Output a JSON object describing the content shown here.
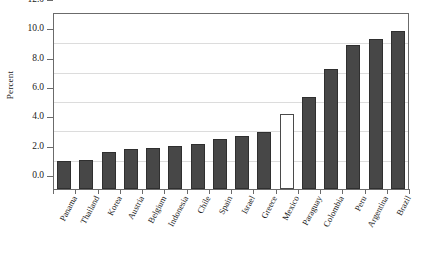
{
  "chart_data": {
    "type": "bar",
    "title": "",
    "xlabel": "",
    "ylabel": "Percent",
    "ylim": [
      0.0,
      12.0
    ],
    "ytick_values": [
      0.0,
      2.0,
      4.0,
      6.0,
      8.0,
      10.0,
      12.0
    ],
    "ytick_labels": [
      "0.0",
      "2.0",
      "4.0",
      "6.0",
      "8.0",
      "10.0",
      "12.0"
    ],
    "grid": true,
    "legend": "none",
    "categories": [
      "Panama",
      "Thailand",
      "Korea",
      "Austria",
      "Belgium",
      "Indonesia",
      "Chile",
      "Spain",
      "Israel",
      "Greece",
      "Mexico",
      "Paraguay",
      "Colombia",
      "Peru",
      "Argentina",
      "Brazil"
    ],
    "values": [
      1.9,
      2.0,
      2.5,
      2.7,
      2.8,
      2.9,
      3.1,
      3.4,
      3.6,
      3.9,
      5.1,
      6.3,
      8.2,
      9.8,
      10.2,
      10.8
    ],
    "highlighted_category": "Mexico",
    "highlight_style": "white-unfilled-bar",
    "bar_color": "#474747",
    "bar_edge_color": "#2f2f2f",
    "highlight_color": "#ffffff",
    "grid_color": "#dcdcdc",
    "axis_color": "#6b6b6b"
  },
  "top_clipped_text": ""
}
